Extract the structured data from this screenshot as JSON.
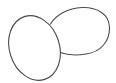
{
  "drawing": {
    "background": "#ffffff",
    "stroke_color": "#4a4a4a",
    "stroke_width": 1.1,
    "shapes": [
      {
        "name": "back-oval",
        "kind": "blob",
        "description": "right oval, behind"
      },
      {
        "name": "front-oval",
        "kind": "ellipse",
        "description": "left tilted oval, in front"
      }
    ]
  }
}
